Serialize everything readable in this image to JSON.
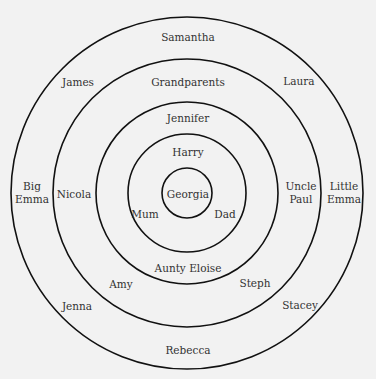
{
  "diagram": {
    "title": "",
    "center": {
      "x": 187,
      "y": 193
    },
    "stroke_color": "#111111",
    "background_color": "#f2f2f2",
    "rings": [
      {
        "name": "ring-1",
        "radius": 25
      },
      {
        "name": "ring-2",
        "radius": 59
      },
      {
        "name": "ring-3",
        "radius": 91
      },
      {
        "name": "ring-4",
        "radius": 134
      },
      {
        "name": "ring-5",
        "radius": 176
      }
    ],
    "labels": {
      "georgia": "Georgia",
      "mum": "Mum",
      "dad": "Dad",
      "harry": "Harry",
      "jennifer": "Jennifer",
      "aunty_eloise": "Aunty Eloise",
      "grandparents": "Grandparents",
      "nicola": "Nicola",
      "uncle_paul_1": "Uncle",
      "uncle_paul_2": "Paul",
      "amy": "Amy",
      "steph": "Steph",
      "samantha": "Samantha",
      "james": "James",
      "laura": "Laura",
      "big_emma_1": "Big",
      "big_emma_2": "Emma",
      "little_emma_1": "Little",
      "little_emma_2": "Emma",
      "jenna": "Jenna",
      "stacey": "Stacey",
      "rebecca": "Rebecca"
    }
  }
}
